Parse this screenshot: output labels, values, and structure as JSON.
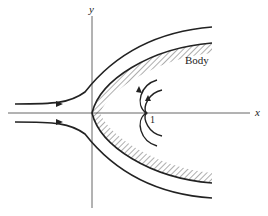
{
  "figure": {
    "axes": {
      "x_label": "x",
      "y_label": "y"
    },
    "labels": {
      "body": "Body",
      "stagnation_point": "1"
    },
    "colors": {
      "ink": "#222222",
      "axis": "#555555",
      "background": "#ffffff"
    },
    "elements": [
      "upper streamline with arrow",
      "lower streamline with arrow",
      "hatched body surface (paraboloid-like nose at origin)",
      "inner curved streamlines near point 1 with arrows"
    ]
  }
}
